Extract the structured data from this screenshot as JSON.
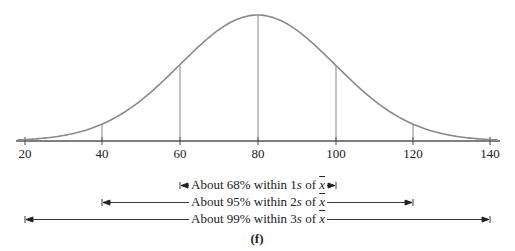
{
  "chart_data": {
    "type": "line",
    "title": "",
    "subtitle": "",
    "xlabel": "",
    "ylabel": "",
    "mean": 80,
    "std_dev": 20,
    "xlim": [
      18,
      142
    ],
    "x_ticks": [
      20,
      40,
      60,
      80,
      100,
      120,
      140
    ],
    "tick_labels": [
      "20",
      "40",
      "60",
      "80",
      "100",
      "120",
      "140"
    ],
    "grid": false,
    "vertical_markers": [
      40,
      60,
      80,
      100,
      120
    ],
    "ranges": [
      {
        "label": "About 68% within 1s of x̄",
        "percent": "About 68%",
        "k": "1s",
        "from": 60,
        "to": 100
      },
      {
        "label": "About 95% within 2s of x̄",
        "percent": "About 95%",
        "k": "2s",
        "from": 40,
        "to": 120
      },
      {
        "label": "About 99% within 3s of x̄",
        "percent": "About 99%",
        "k": "3s",
        "from": 20,
        "to": 140
      }
    ],
    "panel_label": "(f)"
  },
  "labels": {
    "ticks": [
      "20",
      "40",
      "60",
      "80",
      "100",
      "120",
      "140"
    ],
    "r1_pre": "About 68% within 1",
    "r2_pre": "About 95% within 2",
    "r3_pre": "About 99% within 3",
    "s": "s",
    "of": " of ",
    "xbar": "x",
    "panel": "(f)"
  },
  "colors": {
    "curve": "#8a8a8a",
    "axis": "#555555",
    "text": "#222222"
  }
}
